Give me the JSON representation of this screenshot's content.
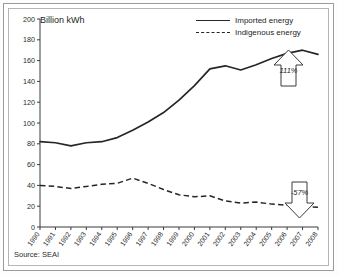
{
  "figure": {
    "axis_title": "Billion kWh",
    "source_note": "Source: SEAI"
  },
  "legend": {
    "position": "top-right",
    "items": [
      {
        "label": "Imported energy",
        "style": "solid",
        "key": "line-solid-icon"
      },
      {
        "label": "Indigenous energy",
        "style": "dashed",
        "key": "line-dashed-icon"
      }
    ]
  },
  "annotations": [
    {
      "name": "growth-arrow-up",
      "icon": "arrow-up-icon",
      "text": "111%",
      "series": "Imported energy"
    },
    {
      "name": "decline-arrow-down",
      "icon": "arrow-down-icon",
      "text": "-57%",
      "series": "Indigenous energy"
    }
  ],
  "chart_data": {
    "type": "line",
    "title": "Billion kWh",
    "xlabel": "",
    "ylabel": "Billion kWh",
    "ylim": [
      0,
      200
    ],
    "ytick_step": 20,
    "yticks": [
      0,
      20,
      40,
      60,
      80,
      100,
      120,
      140,
      160,
      180,
      200
    ],
    "grid": false,
    "legend_position": "top-right",
    "categories": [
      "1990",
      "1991",
      "1992",
      "1993",
      "1994",
      "1995",
      "1996",
      "1997",
      "1998",
      "1999",
      "2000",
      "2001",
      "2002",
      "2003",
      "2004",
      "2005",
      "2006",
      "2007",
      "2008"
    ],
    "series": [
      {
        "name": "Imported energy",
        "style": "solid",
        "values": [
          82,
          81,
          78,
          81,
          82,
          86,
          93,
          101,
          110,
          122,
          136,
          152,
          155,
          151,
          156,
          162,
          167,
          170,
          166
        ]
      },
      {
        "name": "Indigenous energy",
        "style": "dashed",
        "values": [
          40,
          39,
          37,
          39,
          41,
          42,
          47,
          42,
          36,
          31,
          29,
          30,
          25,
          23,
          24,
          22,
          21,
          20,
          19
        ]
      }
    ],
    "annotations": [
      {
        "text": "111%",
        "direction": "up",
        "refers_to": "Imported energy"
      },
      {
        "text": "-57%",
        "direction": "down",
        "refers_to": "Indigenous energy"
      }
    ],
    "source": "Source: SEAI"
  }
}
